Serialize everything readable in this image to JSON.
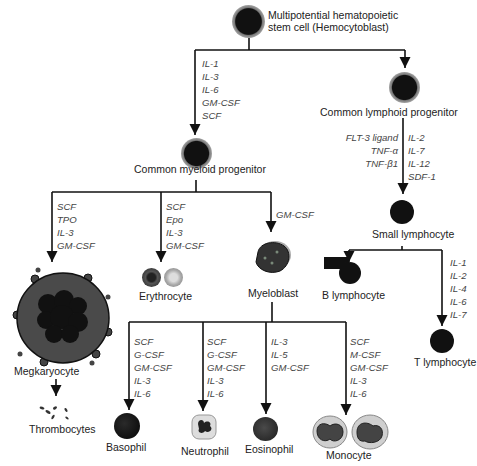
{
  "diagram": {
    "nodes": {
      "hsc": "Multipotential hematopoietic stem cell (Hemocytoblast)",
      "hsc_line1": "Multipotential hematopoietic",
      "hsc_line2": "stem cell (Hemocytoblast)",
      "clp": "Common lymphoid progenitor",
      "cmp": "Common myeloid progenitor",
      "small_lymphocyte": "Small lymphocyte",
      "b_lymphocyte": "B lymphocyte",
      "t_lymphocyte": "T lymphocyte",
      "megakaryocyte": "Megkaryocyte",
      "thrombocytes": "Thrombocytes",
      "erythrocyte": "Erythrocyte",
      "myeloblast": "Myeloblast",
      "basophil": "Basophil",
      "neutrophil": "Neutrophil",
      "eosinophil": "Eosinophil",
      "monocyte": "Monocyte"
    },
    "factors": {
      "hsc_to_cmp": [
        "IL-1",
        "IL-3",
        "IL-6",
        "GM-CSF",
        "SCF"
      ],
      "clp_to_small_left": [
        "FLT-3 ligand",
        "TNF-α",
        "TNF-β1"
      ],
      "clp_to_small_right": [
        "IL-2",
        "IL-7",
        "IL-12",
        "SDF-1"
      ],
      "small_to_t": [
        "IL-1",
        "IL-2",
        "IL-4",
        "IL-6",
        "IL-7"
      ],
      "cmp_to_megakaryocyte": [
        "SCF",
        "TPO",
        "IL-3",
        "GM-CSF"
      ],
      "cmp_to_erythrocyte": [
        "SCF",
        "Epo",
        "IL-3",
        "GM-CSF"
      ],
      "cmp_to_myeloblast": [
        "GM-CSF"
      ],
      "myeloblast_to_basophil": [
        "SCF",
        "G-CSF",
        "GM-CSF",
        "IL-3",
        "IL-6"
      ],
      "myeloblast_to_neutrophil": [
        "SCF",
        "G-CSF",
        "GM-CSF",
        "IL-3",
        "IL-6"
      ],
      "myeloblast_to_eosinophil": [
        "IL-3",
        "IL-5",
        "GM-CSF"
      ],
      "myeloblast_to_monocyte": [
        "SCF",
        "M-CSF",
        "GM-CSF",
        "IL-3",
        "IL-6"
      ]
    },
    "colors": {
      "line": "#111111",
      "cell_dark": "#1a1a1a",
      "cell_ring": "#9a9a9a",
      "cytoplasm": "#4a4a4a"
    }
  }
}
